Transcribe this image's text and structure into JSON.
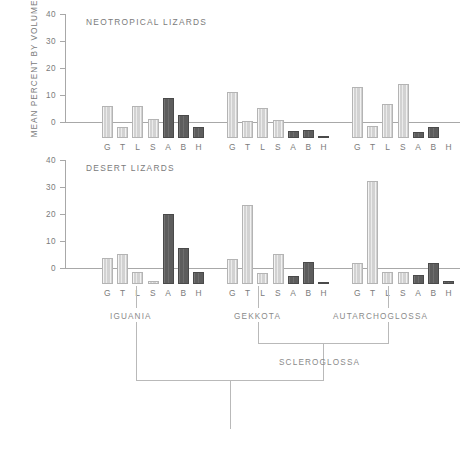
{
  "figure": {
    "ylabel": "MEAN PERCENT BY VOLUME"
  },
  "chart_data": [
    {
      "type": "bar",
      "title": "NEOTROPICAL LIZARDS",
      "xlabel": "",
      "ylabel": "MEAN PERCENT BY VOLUME",
      "ylim": [
        0,
        40
      ],
      "yticks": [
        0,
        10,
        20,
        30,
        40
      ],
      "grid": false,
      "legend": "none",
      "categories": [
        "G",
        "T",
        "L",
        "S",
        "A",
        "B",
        "H"
      ],
      "groups": [
        {
          "name": "IGUANIA",
          "values": [
            12.0,
            4.0,
            12.0,
            7.0,
            15.0,
            8.5,
            4.0
          ],
          "shades": [
            "light",
            "light",
            "light",
            "light",
            "dark",
            "dark",
            "dark"
          ]
        },
        {
          "name": "GEKKOTA",
          "values": [
            17.0,
            6.2,
            11.0,
            6.8,
            2.5,
            2.8,
            0.8
          ],
          "shades": [
            "light",
            "light",
            "light",
            "light",
            "dark",
            "dark",
            "dark"
          ]
        },
        {
          "name": "AUTARCHOGLOSSA",
          "values": [
            19.0,
            4.6,
            12.7,
            20.0,
            2.3,
            4.0,
            0.0
          ],
          "shades": [
            "light",
            "light",
            "light",
            "light",
            "dark",
            "dark",
            "dark"
          ]
        }
      ]
    },
    {
      "type": "bar",
      "title": "DESERT LIZARDS",
      "xlabel": "",
      "ylabel": "MEAN PERCENT BY VOLUME",
      "ylim": [
        0,
        40
      ],
      "yticks": [
        0,
        10,
        20,
        30,
        40
      ],
      "grid": false,
      "legend": "none",
      "categories": [
        "G",
        "T",
        "L",
        "S",
        "A",
        "B",
        "H"
      ],
      "groups": [
        {
          "name": "IGUANIA",
          "values": [
            9.5,
            11.0,
            4.5,
            1.3,
            25.8,
            13.2,
            4.3
          ],
          "shades": [
            "light",
            "light",
            "light",
            "light",
            "dark",
            "dark",
            "dark"
          ]
        },
        {
          "name": "GEKKOTA",
          "values": [
            9.3,
            29.2,
            4.0,
            11.1,
            2.8,
            8.0,
            0.4
          ],
          "shades": [
            "light",
            "light",
            "light",
            "light",
            "dark",
            "dark",
            "dark"
          ]
        },
        {
          "name": "AUTARCHOGLOSSA",
          "values": [
            7.7,
            38.0,
            4.4,
            4.4,
            3.5,
            7.8,
            1.3
          ],
          "shades": [
            "light",
            "light",
            "light",
            "light",
            "dark",
            "dark",
            "dark"
          ]
        }
      ]
    }
  ],
  "cladogram": {
    "nodes": [
      {
        "label": "IGUANIA"
      },
      {
        "label": "GEKKOTA"
      },
      {
        "label": "AUTARCHOGLOSSA"
      },
      {
        "label": "SCLEROGLOSSA"
      }
    ]
  },
  "colors": {
    "bar_light": "#d2d2d2",
    "bar_dark": "#5d5d5d",
    "axis": "#a8a8a8",
    "text": "#7b7b7b",
    "clado_line": "#b9b9b9"
  }
}
